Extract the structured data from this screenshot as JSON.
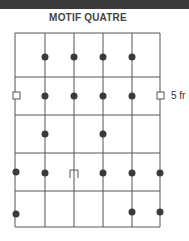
{
  "header": {
    "title": "MOTIF QUATRE"
  },
  "annotation": {
    "label": "5 fr"
  },
  "colors": {
    "line": "#555555",
    "dot": "#3a3a3a",
    "bar": "#3a3a3a"
  },
  "grid": {
    "x_lines": [
      15,
      45,
      74,
      103,
      132,
      160
    ],
    "y_lines": [
      33,
      77,
      115,
      153,
      191,
      227
    ]
  },
  "dots": [
    {
      "x": 45,
      "y": 57
    },
    {
      "x": 74,
      "y": 57
    },
    {
      "x": 103,
      "y": 57
    },
    {
      "x": 132,
      "y": 57
    },
    {
      "x": 45,
      "y": 96
    },
    {
      "x": 74,
      "y": 96
    },
    {
      "x": 103,
      "y": 96
    },
    {
      "x": 132,
      "y": 96
    },
    {
      "x": 45,
      "y": 134
    },
    {
      "x": 103,
      "y": 134
    },
    {
      "x": 16,
      "y": 172
    },
    {
      "x": 45,
      "y": 173
    },
    {
      "x": 103,
      "y": 173
    },
    {
      "x": 132,
      "y": 173
    },
    {
      "x": 160,
      "y": 173
    },
    {
      "x": 16,
      "y": 214
    },
    {
      "x": 132,
      "y": 212
    },
    {
      "x": 160,
      "y": 212
    }
  ],
  "markers": [
    {
      "type": "square",
      "x": 13,
      "y": 92,
      "size": 7
    },
    {
      "type": "square",
      "x": 157,
      "y": 92,
      "size": 7
    },
    {
      "type": "bracket",
      "x": 70,
      "y": 170,
      "w": 8,
      "h": 8
    }
  ]
}
